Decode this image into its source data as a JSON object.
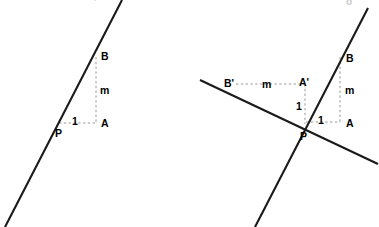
{
  "figure": {
    "background_color": "#ffffff",
    "line_color": "#1a1a1a",
    "dash_color": "#9a9a9a",
    "label_color": "#000000",
    "panels": [
      {
        "id": "left-panel",
        "name": "single-line-slope-diagram",
        "solid_lines": [
          {
            "name": "line-through-P",
            "x1": 5,
            "y1": 227,
            "x2": 122,
            "y2": 0
          }
        ],
        "dashed_segments": [
          {
            "name": "vertical-rise-segment",
            "x1": 96,
            "y1": 57,
            "x2": 96,
            "y2": 123
          },
          {
            "name": "horizontal-run-segment",
            "x1": 59,
            "y1": 123,
            "x2": 96,
            "y2": 123
          }
        ],
        "labels": [
          {
            "name": "point-label-B",
            "text": "B",
            "x": 101,
            "y": 51,
            "kind": "point"
          },
          {
            "name": "length-label-m",
            "text": "m",
            "x": 100,
            "y": 85,
            "kind": "length"
          },
          {
            "name": "length-label-1",
            "text": "1",
            "x": 72,
            "y": 116,
            "kind": "length"
          },
          {
            "name": "point-label-A",
            "text": "A",
            "x": 101,
            "y": 118,
            "kind": "point"
          },
          {
            "name": "point-label-P",
            "text": "P",
            "x": 55,
            "y": 128,
            "kind": "point"
          }
        ],
        "edge_marks": [
          {
            "name": "cropped-glyph-top-left",
            "text": "'",
            "x": 94,
            "y": -2
          }
        ]
      },
      {
        "id": "right-panel",
        "name": "perpendicular-lines-slope-diagram",
        "solid_lines": [
          {
            "name": "steep-line-through-P",
            "x1": 255,
            "y1": 227,
            "x2": 368,
            "y2": 8
          },
          {
            "name": "shallow-perpendicular-line",
            "x1": 200,
            "y1": 80,
            "x2": 378,
            "y2": 164
          }
        ],
        "dashed_segments": [
          {
            "name": "vertical-rise-segment-right",
            "x1": 340,
            "y1": 57,
            "x2": 340,
            "y2": 122
          },
          {
            "name": "horizontal-run-segment-right",
            "x1": 306,
            "y1": 122,
            "x2": 340,
            "y2": 122
          },
          {
            "name": "horizontal-m-segment-left",
            "x1": 236,
            "y1": 84,
            "x2": 305,
            "y2": 84
          },
          {
            "name": "vertical-unit-segment-left",
            "x1": 305,
            "y1": 84,
            "x2": 305,
            "y2": 124
          }
        ],
        "labels": [
          {
            "name": "point-label-B-right",
            "text": "B",
            "x": 346,
            "y": 53,
            "kind": "point"
          },
          {
            "name": "length-label-m-right",
            "text": "m",
            "x": 345,
            "y": 85,
            "kind": "length"
          },
          {
            "name": "length-label-1-right",
            "text": "1",
            "x": 318,
            "y": 115,
            "kind": "length"
          },
          {
            "name": "point-label-A-right",
            "text": "A",
            "x": 346,
            "y": 118,
            "kind": "point"
          },
          {
            "name": "point-label-P-right",
            "text": "P",
            "x": 300,
            "y": 131,
            "kind": "point"
          },
          {
            "name": "point-label-B-prime",
            "text": "B'",
            "x": 224,
            "y": 78,
            "kind": "point"
          },
          {
            "name": "length-label-m-prime",
            "text": "m",
            "x": 262,
            "y": 79,
            "kind": "length"
          },
          {
            "name": "point-label-A-prime",
            "text": "A'",
            "x": 299,
            "y": 77,
            "kind": "point"
          },
          {
            "name": "length-label-1-prime",
            "text": "1",
            "x": 296,
            "y": 101,
            "kind": "length"
          }
        ],
        "edge_marks": [
          {
            "name": "cropped-glyph-top-right",
            "text": "o",
            "x": 346,
            "y": -3
          }
        ]
      }
    ]
  }
}
